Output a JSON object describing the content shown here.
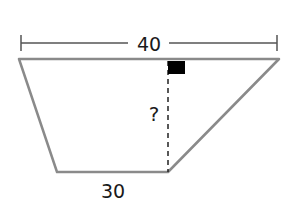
{
  "figure": {
    "type": "trapezoid",
    "top_label": "40",
    "bottom_label": "30",
    "height_label": "?",
    "colors": {
      "outline": "#8a8a8a",
      "dimension_line": "#555555",
      "text": "#1a1a1a",
      "right_angle_marker": "#000000"
    }
  }
}
